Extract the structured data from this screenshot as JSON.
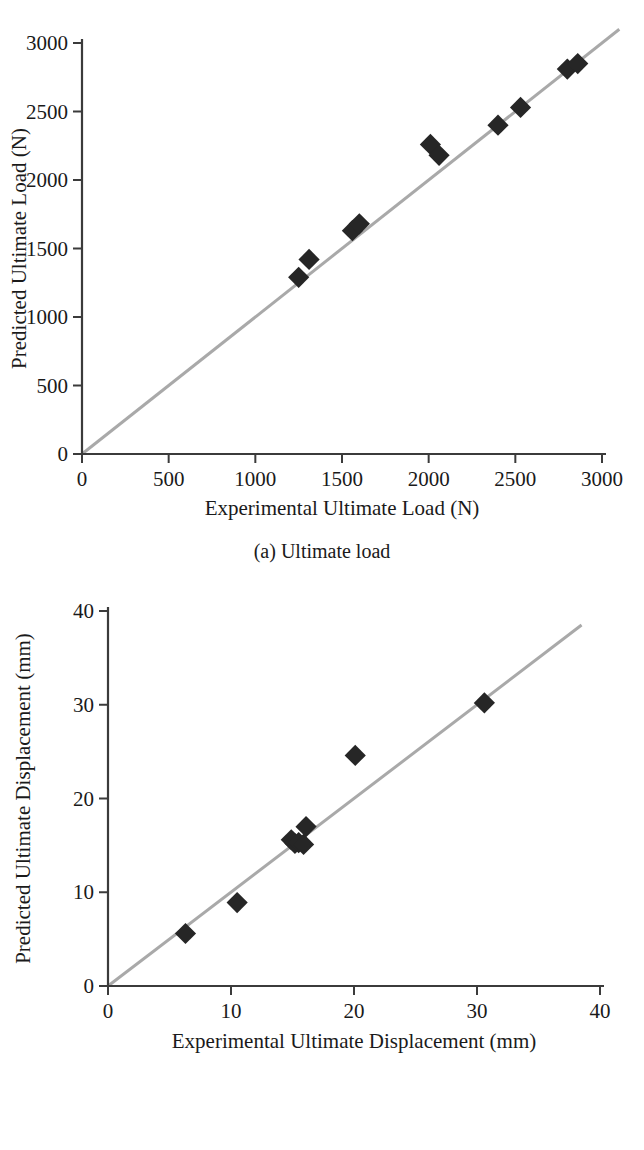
{
  "figure": {
    "panels": [
      {
        "id": "a",
        "caption": "(a) Ultimate load",
        "xlabel": "Experimental Ultimate Load (N)",
        "ylabel": "Predicted Ultimate Load (N)"
      },
      {
        "id": "b",
        "caption": "(b) Ultimate displacement",
        "xlabel": "Experimental Ultimate Displacement (mm)",
        "ylabel": "Predicted Ultimate Displacement (mm)"
      }
    ]
  },
  "colors": {
    "marker": "#262626",
    "reference_line": "#a9a9a9",
    "axis": "#3b3b3b",
    "text": "#1a1a1a",
    "background": "#ffffff"
  },
  "chart_data": [
    {
      "type": "scatter",
      "panel": "a",
      "title": "(a) Ultimate load",
      "xlabel": "Experimental Ultimate Load (N)",
      "ylabel": "Predicted Ultimate Load (N)",
      "xlim": [
        0,
        3000
      ],
      "ylim": [
        0,
        3000
      ],
      "xticks": [
        0,
        500,
        1000,
        1500,
        2000,
        2500,
        3000
      ],
      "yticks": [
        0,
        500,
        1000,
        1500,
        2000,
        2500,
        3000
      ],
      "xticklabels": [
        "0",
        "500",
        "1000",
        "1500",
        "2000",
        "2500",
        "3000"
      ],
      "yticklabels": [
        "0",
        "500",
        "1000",
        "1500",
        "2000",
        "2500",
        "3000"
      ],
      "grid": false,
      "legend": null,
      "marker_shape": "diamond",
      "marker_size_px": 15,
      "reference_line": {
        "label": "1:1 equality line",
        "slope": 1,
        "intercept": 0,
        "x_from": 0,
        "x_to": 3100
      },
      "points": [
        {
          "x": 1250,
          "y": 1290
        },
        {
          "x": 1310,
          "y": 1420
        },
        {
          "x": 1560,
          "y": 1630
        },
        {
          "x": 1600,
          "y": 1680
        },
        {
          "x": 2010,
          "y": 2260
        },
        {
          "x": 2060,
          "y": 2180
        },
        {
          "x": 2400,
          "y": 2400
        },
        {
          "x": 2530,
          "y": 2530
        },
        {
          "x": 2800,
          "y": 2810
        },
        {
          "x": 2860,
          "y": 2850
        }
      ]
    },
    {
      "type": "scatter",
      "panel": "b",
      "title": "(b) Ultimate displacement",
      "xlabel": "Experimental Ultimate Displacement (mm)",
      "ylabel": "Predicted Ultimate Displacement (mm)",
      "xlim": [
        0,
        40
      ],
      "ylim": [
        0,
        40
      ],
      "xticks": [
        0,
        10,
        20,
        30,
        40
      ],
      "yticks": [
        0,
        10,
        20,
        30,
        40
      ],
      "xticklabels": [
        "0",
        "10",
        "20",
        "30",
        "40"
      ],
      "yticklabels": [
        "0",
        "10",
        "20",
        "30",
        "40"
      ],
      "grid": false,
      "legend": null,
      "marker_shape": "diamond",
      "marker_size_px": 15,
      "reference_line": {
        "label": "1:1 equality line",
        "slope": 1,
        "intercept": 0,
        "x_from": 0,
        "x_to": 38.5
      },
      "points": [
        {
          "x": 6.3,
          "y": 5.6
        },
        {
          "x": 10.5,
          "y": 8.9
        },
        {
          "x": 14.9,
          "y": 15.6
        },
        {
          "x": 15.2,
          "y": 15.2
        },
        {
          "x": 15.5,
          "y": 15.3
        },
        {
          "x": 15.9,
          "y": 15.1
        },
        {
          "x": 16.1,
          "y": 17.0
        },
        {
          "x": 20.1,
          "y": 24.6
        },
        {
          "x": 30.6,
          "y": 30.2
        }
      ]
    }
  ]
}
